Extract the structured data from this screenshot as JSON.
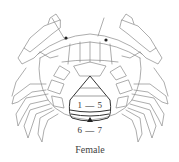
{
  "figure": {
    "caption": "Female",
    "abdomen_label_upper": "1 — 5",
    "abdomen_label_lower": "6 — 7",
    "pointer_icon": "triangle-up-icon"
  },
  "colors": {
    "line": "#7a7a7a",
    "dark_line": "#333333",
    "background": "#ffffff"
  }
}
